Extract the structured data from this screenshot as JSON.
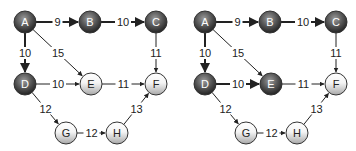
{
  "figure": {
    "colors": {
      "visited_fill_light": "#8a8a8a",
      "visited_fill_dark": "#2e2e2e",
      "unvisited_fill_light": "#ffffff",
      "unvisited_fill_dark": "#b8b8b8",
      "edge": "#222222",
      "visited_label": "#ffffff",
      "unvisited_label": "#222222"
    }
  },
  "graphs": [
    {
      "id": "left",
      "offset_x": 0,
      "nodes": [
        {
          "id": "A",
          "label": "A",
          "x": 25,
          "y": 22,
          "visited": true
        },
        {
          "id": "B",
          "label": "B",
          "x": 90,
          "y": 22,
          "visited": true
        },
        {
          "id": "C",
          "label": "C",
          "x": 156,
          "y": 22,
          "visited": true
        },
        {
          "id": "D",
          "label": "D",
          "x": 25,
          "y": 84,
          "visited": true
        },
        {
          "id": "E",
          "label": "E",
          "x": 91,
          "y": 84,
          "visited": false
        },
        {
          "id": "F",
          "label": "F",
          "x": 156,
          "y": 84,
          "visited": false
        },
        {
          "id": "G",
          "label": "G",
          "x": 66,
          "y": 133,
          "visited": false
        },
        {
          "id": "H",
          "label": "H",
          "x": 117,
          "y": 133,
          "visited": false
        }
      ],
      "edges": [
        {
          "from": "A",
          "to": "B",
          "weight": "9",
          "bold": true
        },
        {
          "from": "B",
          "to": "C",
          "weight": "10",
          "bold": true
        },
        {
          "from": "A",
          "to": "D",
          "weight": "10",
          "bold": true
        },
        {
          "from": "A",
          "to": "E",
          "weight": "15",
          "bold": false
        },
        {
          "from": "C",
          "to": "F",
          "weight": "11",
          "bold": false
        },
        {
          "from": "D",
          "to": "E",
          "weight": "10",
          "bold": false
        },
        {
          "from": "E",
          "to": "F",
          "weight": "11",
          "bold": false
        },
        {
          "from": "D",
          "to": "G",
          "weight": "12",
          "bold": false
        },
        {
          "from": "G",
          "to": "H",
          "weight": "12",
          "bold": false
        },
        {
          "from": "H",
          "to": "F",
          "weight": "13",
          "bold": false
        }
      ]
    },
    {
      "id": "right",
      "offset_x": 180,
      "nodes": [
        {
          "id": "A",
          "label": "A",
          "x": 25,
          "y": 22,
          "visited": true
        },
        {
          "id": "B",
          "label": "B",
          "x": 90,
          "y": 22,
          "visited": true
        },
        {
          "id": "C",
          "label": "C",
          "x": 156,
          "y": 22,
          "visited": true
        },
        {
          "id": "D",
          "label": "D",
          "x": 25,
          "y": 84,
          "visited": true
        },
        {
          "id": "E",
          "label": "E",
          "x": 91,
          "y": 84,
          "visited": true
        },
        {
          "id": "F",
          "label": "F",
          "x": 156,
          "y": 84,
          "visited": false
        },
        {
          "id": "G",
          "label": "G",
          "x": 66,
          "y": 133,
          "visited": false
        },
        {
          "id": "H",
          "label": "H",
          "x": 117,
          "y": 133,
          "visited": false
        }
      ],
      "edges": [
        {
          "from": "A",
          "to": "B",
          "weight": "9",
          "bold": true
        },
        {
          "from": "B",
          "to": "C",
          "weight": "10",
          "bold": true
        },
        {
          "from": "A",
          "to": "D",
          "weight": "10",
          "bold": true
        },
        {
          "from": "A",
          "to": "E",
          "weight": "15",
          "bold": false
        },
        {
          "from": "C",
          "to": "F",
          "weight": "11",
          "bold": false
        },
        {
          "from": "D",
          "to": "E",
          "weight": "10",
          "bold": true
        },
        {
          "from": "E",
          "to": "F",
          "weight": "11",
          "bold": false
        },
        {
          "from": "D",
          "to": "G",
          "weight": "12",
          "bold": false
        },
        {
          "from": "G",
          "to": "H",
          "weight": "12",
          "bold": false
        },
        {
          "from": "H",
          "to": "F",
          "weight": "13",
          "bold": false
        }
      ]
    }
  ]
}
